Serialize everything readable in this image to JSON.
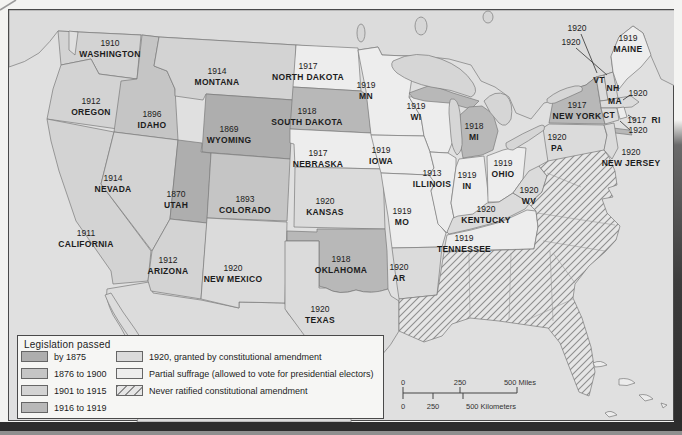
{
  "legend": {
    "title": "Legislation passed",
    "left_items": [
      {
        "label": "by 1875",
        "cat": "cat1875"
      },
      {
        "label": "1876 to 1900",
        "cat": "cat1876_1900"
      },
      {
        "label": "1901 to 1915",
        "cat": "cat1901_1915"
      },
      {
        "label": "1916 to 1919",
        "cat": "cat1916_1919"
      }
    ],
    "right_items": [
      {
        "label": "1920, granted by constitutional amendment",
        "cat": "cat1920"
      },
      {
        "label": "Partial suffrage (allowed to vote for presidential electors)",
        "cat": "partial"
      },
      {
        "label": "Never ratified constitutional amendment",
        "cat": "hatched"
      }
    ]
  },
  "scale_bar": {
    "miles_labels": [
      "0",
      "250",
      "500 Miles"
    ],
    "km_labels": [
      "0",
      "250",
      "500 Kilometers"
    ]
  },
  "colors": {
    "cat1875": "#aeaeae",
    "cat1876_1900": "#c5c5c5",
    "cat1901_1915": "#d3d3d3",
    "cat1916_1919": "#b8b8b8",
    "cat1920": "#dbdbdb",
    "partial": "#ededed",
    "hatch_bg": "#e6e6e6",
    "hatch_line": "#8f8f8f",
    "ocean": "#e0e0e0",
    "neighbor_land": "#dcdcdc",
    "lake": "#d6d6d6",
    "border": "#7a7a7a",
    "text": "#1c1c1c"
  },
  "states": [
    {
      "id": "washington",
      "year": "1910",
      "name": "WASHINGTON",
      "x": 110,
      "y": 48,
      "cat": "cat1901_1915"
    },
    {
      "id": "oregon",
      "year": "1912",
      "name": "OREGON",
      "x": 91,
      "y": 106,
      "cat": "cat1901_1915"
    },
    {
      "id": "california",
      "year": "1911",
      "name": "CALIFORNIA",
      "x": 86,
      "y": 238,
      "cat": "cat1901_1915"
    },
    {
      "id": "nevada",
      "year": "1914",
      "name": "NEVADA",
      "x": 113,
      "y": 183,
      "cat": "cat1901_1915"
    },
    {
      "id": "idaho",
      "year": "1896",
      "name": "IDAHO",
      "x": 152,
      "y": 119,
      "cat": "cat1876_1900"
    },
    {
      "id": "montana",
      "year": "1914",
      "name": "MONTANA",
      "x": 217,
      "y": 76,
      "cat": "cat1901_1915"
    },
    {
      "id": "wyoming",
      "year": "1869",
      "name": "WYOMING",
      "x": 229,
      "y": 134,
      "cat": "cat1875"
    },
    {
      "id": "utah",
      "year": "1870",
      "name": "UTAH",
      "x": 176,
      "y": 199,
      "cat": "cat1875"
    },
    {
      "id": "colorado",
      "year": "1893",
      "name": "COLORADO",
      "x": 245,
      "y": 204,
      "cat": "cat1876_1900"
    },
    {
      "id": "arizona",
      "year": "1912",
      "name": "ARIZONA",
      "x": 168,
      "y": 265,
      "cat": "cat1901_1915"
    },
    {
      "id": "new-mexico",
      "year": "1920",
      "name": "NEW MEXICO",
      "x": 233,
      "y": 273,
      "cat": "cat1920"
    },
    {
      "id": "north-dakota",
      "year": "1917",
      "name": "NORTH DAKOTA",
      "x": 308,
      "y": 71,
      "cat": "partial"
    },
    {
      "id": "south-dakota",
      "year": "1918",
      "name": "SOUTH DAKOTA",
      "x": 307,
      "y": 116,
      "cat": "cat1916_1919"
    },
    {
      "id": "nebraska",
      "year": "1917",
      "name": "NEBRASKA",
      "x": 318,
      "y": 158,
      "cat": "partial"
    },
    {
      "id": "kansas",
      "year": "1920",
      "name": "KANSAS",
      "x": 325,
      "y": 206,
      "cat": "cat1920"
    },
    {
      "id": "oklahoma",
      "year": "1918",
      "name": "OKLAHOMA",
      "x": 341,
      "y": 264,
      "cat": "cat1916_1919"
    },
    {
      "id": "texas",
      "year": "1920",
      "name": "TEXAS",
      "x": 320,
      "y": 314,
      "cat": "cat1920"
    },
    {
      "id": "minnesota",
      "year": "1919",
      "name": "MN",
      "x": 366,
      "y": 90,
      "cat": "partial"
    },
    {
      "id": "iowa",
      "year": "1919",
      "name": "IOWA",
      "x": 381,
      "y": 155,
      "cat": "partial"
    },
    {
      "id": "missouri",
      "year": "1919",
      "name": "MO",
      "x": 402,
      "y": 216,
      "cat": "partial"
    },
    {
      "id": "arkansas",
      "year": "1920",
      "name": "AR",
      "x": 399,
      "y": 272,
      "cat": "cat1920"
    },
    {
      "id": "wisconsin",
      "year": "1919",
      "name": "WI",
      "x": 416,
      "y": 111,
      "cat": "partial"
    },
    {
      "id": "illinois",
      "year": "1913",
      "name": "ILLINOIS",
      "x": 432,
      "y": 178,
      "cat": "partial"
    },
    {
      "id": "indiana",
      "year": "1919",
      "name": "IN",
      "x": 467,
      "y": 180,
      "cat": "partial"
    },
    {
      "id": "michigan",
      "year": "1918",
      "name": "MI",
      "x": 474,
      "y": 131,
      "cat": "cat1916_1919"
    },
    {
      "id": "ohio",
      "year": "1919",
      "name": "OHIO",
      "x": 503,
      "y": 168,
      "cat": "partial"
    },
    {
      "id": "kentucky",
      "year": "1920",
      "name": "KENTUCKY",
      "x": 486,
      "y": 214,
      "cat": "cat1920"
    },
    {
      "id": "tennessee",
      "year": "1919",
      "name": "TENNESSEE",
      "x": 464,
      "y": 243,
      "cat": "partial"
    },
    {
      "id": "west-virginia",
      "year": "1920",
      "name": "WV",
      "x": 529,
      "y": 195,
      "cat": "cat1920"
    },
    {
      "id": "new-york",
      "year": "1917",
      "name": "NEW YORK",
      "x": 577,
      "y": 110,
      "cat": "cat1916_1919"
    },
    {
      "id": "pennsylvania",
      "year": "1920",
      "name": "PA",
      "x": 557,
      "y": 142,
      "cat": "cat1920"
    },
    {
      "id": "new-jersey",
      "year": "1920",
      "name": "NEW JERSEY",
      "x": 631,
      "y": 157,
      "cat": "cat1920"
    },
    {
      "id": "maine",
      "year": "1919",
      "name": "MAINE",
      "x": 628,
      "y": 43,
      "cat": "partial"
    },
    {
      "id": "vermont",
      "year": "",
      "name": "VT",
      "x": 599,
      "y": 80,
      "cat": "cat1920"
    },
    {
      "id": "new-hampshire",
      "year": "",
      "name": "NH",
      "x": 613,
      "y": 88,
      "cat": "cat1920"
    },
    {
      "id": "massachusetts",
      "year": "",
      "name": "MA",
      "x": 615,
      "y": 101,
      "cat": "cat1920"
    },
    {
      "id": "connecticut",
      "year": "",
      "name": "CT",
      "x": 609,
      "y": 115,
      "cat": "cat1920"
    },
    {
      "id": "rhode-island",
      "year": "1917",
      "name": "RI",
      "x": 644,
      "y": 120,
      "cat": "partial",
      "inline": true
    },
    {
      "id": "vermont-callout",
      "year": "1920",
      "name": "",
      "x": 577,
      "y": 28,
      "cat": "cat1920"
    },
    {
      "id": "new-hampshire-callout",
      "year": "1920",
      "name": "",
      "x": 571,
      "y": 42,
      "cat": "cat1920"
    },
    {
      "id": "massachusetts-callout",
      "year": "1920",
      "name": "",
      "x": 638,
      "y": 93,
      "cat": "cat1920"
    },
    {
      "id": "connecticut-callout",
      "year": "1920",
      "name": "",
      "x": 638,
      "y": 130,
      "cat": "cat1920"
    }
  ]
}
